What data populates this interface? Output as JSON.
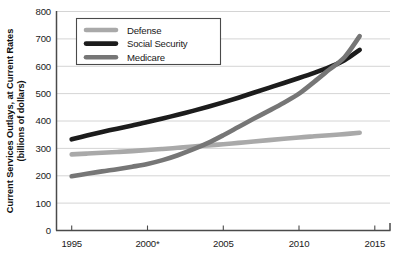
{
  "chart_data": {
    "type": "line",
    "title": "",
    "xlabel": "",
    "ylabel": "Current Services Outlays, at Current Rates (billions of dollars)",
    "ylabel_line1": "Current Services Outlays, at Current Rates",
    "ylabel_line2": "(billions of dollars)",
    "xlim": [
      1994,
      2016
    ],
    "ylim": [
      0,
      800
    ],
    "grid": true,
    "legend_position": "top-left-inside",
    "x_tick_labels": [
      "1995",
      "2000*",
      "2005",
      "2010",
      "2015"
    ],
    "x_tick_values": [
      1995,
      2000,
      2005,
      2010,
      2015
    ],
    "y_tick_labels": [
      "0",
      "100",
      "200",
      "300",
      "400",
      "500",
      "600",
      "700",
      "800"
    ],
    "y_tick_values": [
      0,
      100,
      200,
      300,
      400,
      500,
      600,
      700,
      800
    ],
    "footnote_marker": "*",
    "x": [
      1995,
      1996,
      1997,
      1998,
      1999,
      2000,
      2001,
      2002,
      2003,
      2004,
      2005,
      2006,
      2007,
      2008,
      2009,
      2010,
      2011,
      2012,
      2013,
      2014
    ],
    "series": [
      {
        "name": "Defense",
        "color": "#a9a9a9",
        "values": [
          278,
          281,
          284,
          287,
          290,
          294,
          298,
          302,
          307,
          311,
          315,
          320,
          325,
          330,
          335,
          340,
          344,
          348,
          352,
          357
        ]
      },
      {
        "name": "Social Security",
        "color": "#1c1c1c",
        "values": [
          333,
          347,
          360,
          372,
          384,
          396,
          409,
          423,
          437,
          452,
          468,
          485,
          503,
          521,
          539,
          557,
          576,
          597,
          622,
          660
        ]
      },
      {
        "name": "Medicare",
        "color": "#767676",
        "values": [
          198,
          207,
          216,
          224,
          233,
          243,
          257,
          275,
          296,
          320,
          348,
          378,
          408,
          437,
          467,
          500,
          543,
          588,
          633,
          710
        ]
      }
    ],
    "legend_entries": [
      {
        "label": "Defense",
        "color": "#a9a9a9"
      },
      {
        "label": "Social Security",
        "color": "#1c1c1c"
      },
      {
        "label": "Medicare",
        "color": "#767676"
      }
    ]
  },
  "colors": {
    "defense": "#a9a9a9",
    "social_security": "#1c1c1c",
    "medicare": "#767676",
    "grid": "#c9c9c9",
    "axis": "#4a4a4a",
    "background": "#ffffff"
  }
}
